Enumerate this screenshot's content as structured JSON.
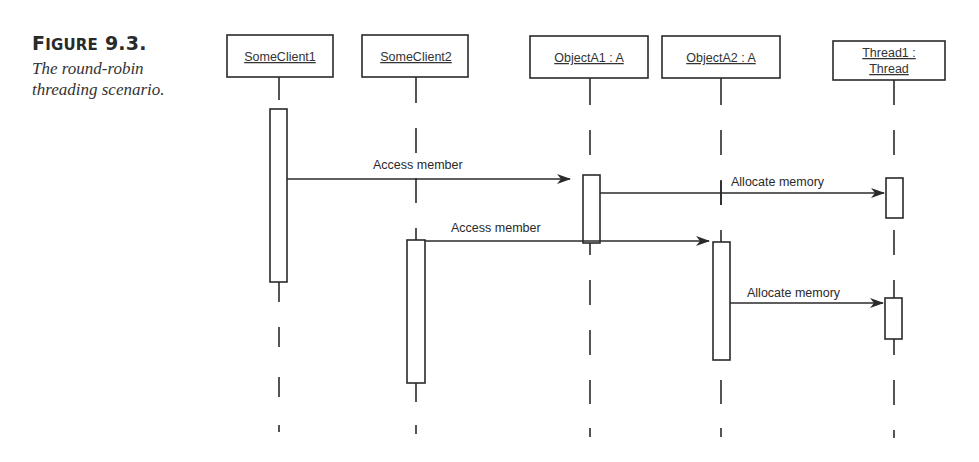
{
  "figure": {
    "label_prefix": "F",
    "label_smallcaps": "IGURE",
    "label_number": " 9.3.",
    "description": "The round-robin threading scenario."
  },
  "diagram": {
    "type": "uml-sequence",
    "objects": [
      {
        "id": "someclient1",
        "name": "SomeClient1",
        "x": 279,
        "box": [
          227,
          35,
          106,
          42
        ]
      },
      {
        "id": "someclient2",
        "name": "SomeClient2",
        "x": 416,
        "box": [
          362,
          35,
          106,
          42
        ]
      },
      {
        "id": "objecta1",
        "name": "ObjectA1 : A",
        "x": 590,
        "box": [
          530,
          36,
          118,
          42
        ]
      },
      {
        "id": "objecta2",
        "name": "ObjectA2 : A",
        "x": 721,
        "box": [
          662,
          36,
          118,
          42
        ]
      },
      {
        "id": "thread1",
        "name_line1": "Thread1 :",
        "name_line2": "Thread",
        "x": 894,
        "box": [
          833,
          41,
          112,
          39
        ]
      }
    ],
    "messages": [
      {
        "id": "msg1",
        "label": "Access member",
        "from": "SomeClient1",
        "to": "ObjectA1 : A"
      },
      {
        "id": "msg2",
        "label": "Allocate memory",
        "from": "ObjectA1 : A",
        "to": "Thread1 : Thread"
      },
      {
        "id": "msg3",
        "label": "Access member",
        "from": "SomeClient2",
        "to": "ObjectA2 : A"
      },
      {
        "id": "msg4",
        "label": "Allocate memory",
        "from": "ObjectA2 : A",
        "to": "Thread1 : Thread"
      }
    ]
  }
}
